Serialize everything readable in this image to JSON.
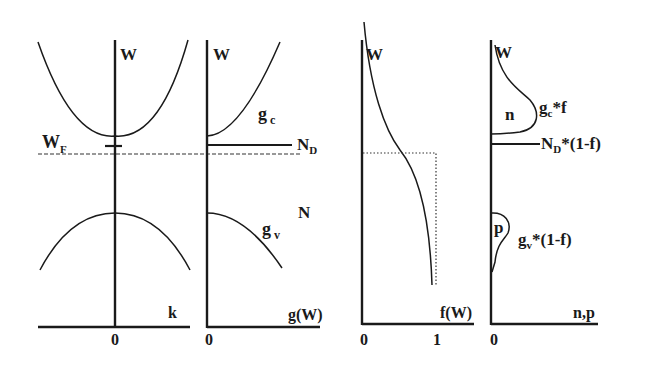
{
  "panels": {
    "band": {
      "y_axis_label": "W",
      "x_axis_label": "k",
      "origin_label": "0",
      "fermi_label_main": "W",
      "fermi_label_sub": "F"
    },
    "dos": {
      "y_axis_label": "W",
      "x_axis_label": "g(W)",
      "origin_label": "0",
      "gc_main": "g",
      "gc_sub": "c",
      "gv_main": "g",
      "gv_sub": "v",
      "nd_main": "N",
      "nd_sub": "D",
      "n_label": "N"
    },
    "fermi": {
      "y_axis_label": "W",
      "x_axis_label": "f(W)",
      "tick_0": "0",
      "tick_1": "1"
    },
    "carriers": {
      "y_axis_label": "W",
      "x_axis_label": "n,p",
      "origin_label": "0",
      "n_area_label": "n",
      "p_area_label": "p",
      "gcf_main": "g",
      "gcf_sub": "c",
      "gcf_rest": "*f",
      "nd_main": "N",
      "nd_sub": "D",
      "nd_rest": "*(1-f)",
      "gvf_main": "g",
      "gvf_sub": "v",
      "gvf_rest": "*(1-f)"
    }
  },
  "colors": {
    "ink": "#1a1a1a",
    "background": "#ffffff"
  }
}
